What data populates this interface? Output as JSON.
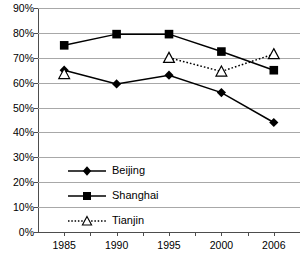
{
  "chart_data": {
    "type": "line",
    "title": "",
    "xlabel": "",
    "ylabel": "",
    "categories": [
      "1985",
      "1990",
      "1995",
      "2000",
      "2006"
    ],
    "ylim": [
      0,
      90
    ],
    "ytick_step": 10,
    "ytick_labels": [
      "0%",
      "10%",
      "20%",
      "30%",
      "40%",
      "50%",
      "60%",
      "70%",
      "80%",
      "90%"
    ],
    "ytick_values": [
      0,
      10,
      20,
      30,
      40,
      50,
      60,
      70,
      80,
      90
    ],
    "grid": true,
    "legend_position": "inside-lower-left",
    "value_suffix": "%",
    "series": [
      {
        "name": "Beijing",
        "marker": "filled-diamond",
        "line_style": "solid",
        "color": "#000000",
        "values": [
          65,
          59.5,
          63,
          56,
          44
        ]
      },
      {
        "name": "Shanghai",
        "marker": "filled-square",
        "line_style": "solid",
        "color": "#000000",
        "values": [
          75,
          79.5,
          79.5,
          72.5,
          65
        ]
      },
      {
        "name": "Tianjin",
        "marker": "open-triangle",
        "line_style": "dotted",
        "color": "#000000",
        "values": [
          63.5,
          null,
          70,
          64.5,
          71.5
        ]
      }
    ]
  },
  "legend": {
    "items": [
      {
        "label": "Beijing"
      },
      {
        "label": "Shanghai"
      },
      {
        "label": "Tianjin"
      }
    ]
  },
  "top_cropped_text": ""
}
